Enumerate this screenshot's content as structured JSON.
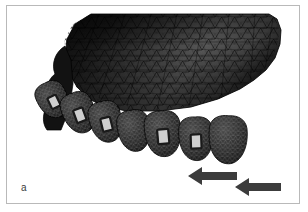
{
  "figure": {
    "panel_label": "a",
    "caption_text": "",
    "background_color": "#ffffff",
    "frame_color": "#b9b9b9"
  },
  "model": {
    "bone_label": "maxillary-bone-mesh",
    "bone_fill_dark": "#131313",
    "bone_fill_mid": "#474747",
    "bone_fill_light": "#6f6f6f",
    "mesh_line_color": "#0d0d0d",
    "mesh_type": "triangular-finite-element-mesh",
    "teeth_count": 7,
    "tooth_fill": "#2a2a2a",
    "tooth_mesh_color": "#d9d9d9",
    "bracket_fill": "#cfcfcf",
    "teeth": [
      {
        "name": "tooth-1",
        "cx": 46,
        "cy": 94,
        "rx": 15,
        "ry": 17,
        "rot": -26,
        "bracket": true
      },
      {
        "name": "tooth-2",
        "cx": 72,
        "cy": 107,
        "rx": 16,
        "ry": 19,
        "rot": -20,
        "bracket": true
      },
      {
        "name": "tooth-3",
        "cx": 99,
        "cy": 116,
        "rx": 16,
        "ry": 19,
        "rot": -14,
        "bracket": true
      },
      {
        "name": "tooth-4",
        "cx": 127,
        "cy": 125,
        "rx": 16,
        "ry": 19,
        "rot": -9,
        "bracket": false
      },
      {
        "name": "tooth-5",
        "cx": 156,
        "cy": 128,
        "rx": 18,
        "ry": 21,
        "rot": -5,
        "bracket": true
      },
      {
        "name": "tooth-6",
        "cx": 189,
        "cy": 133,
        "rx": 17,
        "ry": 20,
        "rot": -2,
        "bracket": true
      },
      {
        "name": "tooth-7",
        "cx": 221,
        "cy": 134,
        "rx": 19,
        "ry": 22,
        "rot": 2,
        "bracket": false
      }
    ]
  },
  "annotations": {
    "arrow_color": "#3c3c3c",
    "arrows": [
      {
        "name": "force-arrow-upper",
        "direction": "left",
        "tail_x": 230,
        "tip_x": 181,
        "y": 170,
        "shaft_h": 8,
        "head_w": 14,
        "head_h": 18
      },
      {
        "name": "force-arrow-lower",
        "direction": "left",
        "tail_x": 274,
        "tip_x": 228,
        "y": 181,
        "shaft_h": 8,
        "head_w": 14,
        "head_h": 18
      }
    ],
    "arrow_count": 2,
    "arrow_meaning": "applied-force-direction"
  }
}
